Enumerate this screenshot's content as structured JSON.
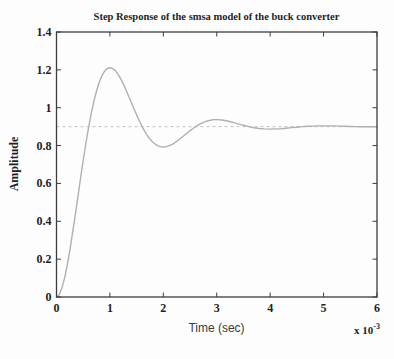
{
  "figure": {
    "background": "#fdfdfd",
    "text_color": "#1f1f1f"
  },
  "chart_data": {
    "type": "line",
    "title": "Step Response of the smsa model of the buck converter",
    "xlabel": "Time (sec)",
    "ylabel": "Amplitude",
    "x_scale_base": "x 10",
    "x_scale_exponent": "-3",
    "xlim": [
      0,
      6
    ],
    "ylim": [
      0,
      1.4
    ],
    "x_ticks": [
      0,
      1,
      2,
      3,
      4,
      5,
      6
    ],
    "x_tick_labels": [
      "0",
      "1",
      "2",
      "3",
      "4",
      "5",
      "6"
    ],
    "y_ticks": [
      0,
      0.2,
      0.4,
      0.6,
      0.8,
      1,
      1.2,
      1.4
    ],
    "y_tick_labels": [
      "0",
      "0.2",
      "0.4",
      "0.6",
      "0.8",
      "1",
      "1.2",
      "1.4"
    ],
    "grid": false,
    "legend": null,
    "axis_color": "#3d3d3d",
    "reference_line": {
      "value": 0.9,
      "style": "dashed",
      "color": "#c0c0c0"
    },
    "series": [
      {
        "name": "step-response",
        "color": "#b0b0b0",
        "x": [
          0,
          0.05,
          0.1,
          0.15,
          0.2,
          0.25,
          0.3,
          0.35,
          0.4,
          0.45,
          0.5,
          0.55,
          0.6,
          0.65,
          0.7,
          0.75,
          0.8,
          0.85,
          0.9,
          0.95,
          1,
          1.05,
          1.1,
          1.15,
          1.2,
          1.25,
          1.3,
          1.35,
          1.4,
          1.45,
          1.5,
          1.55,
          1.6,
          1.65,
          1.7,
          1.75,
          1.8,
          1.85,
          1.9,
          1.95,
          2,
          2.05,
          2.1,
          2.15,
          2.2,
          2.25,
          2.3,
          2.35,
          2.4,
          2.45,
          2.5,
          2.55,
          2.6,
          2.65,
          2.7,
          2.75,
          2.8,
          2.85,
          2.9,
          2.95,
          3,
          3.1,
          3.2,
          3.3,
          3.4,
          3.5,
          3.6,
          3.7,
          3.8,
          3.9,
          4,
          4.1,
          4.2,
          4.3,
          4.4,
          4.5,
          4.6,
          4.7,
          4.8,
          4.9,
          5,
          5.1,
          5.2,
          5.3,
          5.4,
          5.5,
          5.6,
          5.7,
          5.8,
          5.9,
          6
        ],
        "y": [
          0,
          0.012,
          0.046,
          0.098,
          0.166,
          0.247,
          0.337,
          0.431,
          0.529,
          0.626,
          0.721,
          0.811,
          0.894,
          0.969,
          1.035,
          1.09,
          1.135,
          1.169,
          1.193,
          1.207,
          1.211,
          1.207,
          1.196,
          1.178,
          1.154,
          1.126,
          1.095,
          1.062,
          1.028,
          0.995,
          0.962,
          0.931,
          0.902,
          0.876,
          0.853,
          0.834,
          0.819,
          0.807,
          0.799,
          0.794,
          0.792,
          0.794,
          0.798,
          0.804,
          0.812,
          0.822,
          0.833,
          0.844,
          0.856,
          0.867,
          0.879,
          0.889,
          0.899,
          0.908,
          0.916,
          0.923,
          0.928,
          0.932,
          0.935,
          0.937,
          0.937,
          0.935,
          0.93,
          0.923,
          0.915,
          0.907,
          0.9,
          0.894,
          0.89,
          0.888,
          0.887,
          0.888,
          0.889,
          0.892,
          0.895,
          0.897,
          0.9,
          0.902,
          0.903,
          0.904,
          0.904,
          0.904,
          0.904,
          0.903,
          0.902,
          0.901,
          0.9,
          0.899,
          0.899,
          0.899,
          0.898
        ]
      }
    ]
  }
}
